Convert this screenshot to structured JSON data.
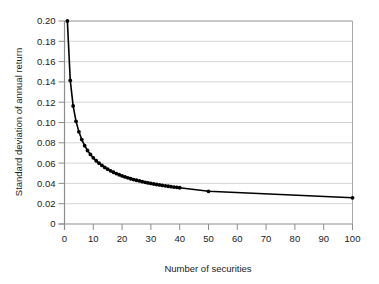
{
  "chart_data": {
    "type": "line",
    "title": "",
    "xlabel": "Number of securities",
    "ylabel": "Standard deviation of annual return",
    "xlim": [
      0,
      100
    ],
    "ylim": [
      0,
      0.2
    ],
    "xticks": [
      0,
      10,
      20,
      30,
      40,
      50,
      60,
      70,
      80,
      90,
      100
    ],
    "xtick_labels": [
      "0",
      "10",
      "20",
      "30",
      "40",
      "50",
      "60",
      "70",
      "80",
      "90",
      "100"
    ],
    "yticks": [
      0,
      0.02,
      0.04,
      0.06,
      0.08,
      0.1,
      0.12,
      0.14,
      0.16,
      0.18,
      0.2
    ],
    "ytick_labels": [
      "0",
      "0.02",
      "0.04",
      "0.06",
      "0.08",
      "0.10",
      "0.12",
      "0.14",
      "0.16",
      "0.18",
      "0.20"
    ],
    "grid": "horizontal",
    "legend": "none",
    "marker": "filled-circle",
    "line_color": "#000000",
    "grid_color": "#c9c9c9",
    "frame_color": "#a8a8a8",
    "x": [
      1,
      2,
      3,
      4,
      5,
      6,
      7,
      8,
      9,
      10,
      11,
      12,
      13,
      14,
      15,
      16,
      17,
      18,
      19,
      20,
      21,
      22,
      23,
      24,
      25,
      26,
      27,
      28,
      29,
      30,
      31,
      32,
      33,
      34,
      35,
      36,
      37,
      38,
      39,
      40,
      50,
      100
    ],
    "values": [
      0.2,
      0.1415,
      0.1163,
      0.1012,
      0.0908,
      0.0832,
      0.0772,
      0.0724,
      0.0685,
      0.0652,
      0.0623,
      0.0599,
      0.0577,
      0.0557,
      0.054,
      0.0524,
      0.051,
      0.0497,
      0.0485,
      0.0474,
      0.0464,
      0.0455,
      0.0446,
      0.0438,
      0.0431,
      0.0424,
      0.0417,
      0.0411,
      0.0405,
      0.04,
      0.0394,
      0.0389,
      0.0385,
      0.038,
      0.0376,
      0.0372,
      0.0368,
      0.0364,
      0.0361,
      0.0357,
      0.0322,
      0.0258
    ]
  }
}
